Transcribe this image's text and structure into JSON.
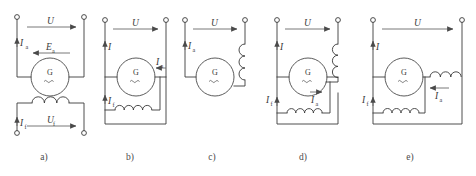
{
  "figure": {
    "type": "schematic-diagram",
    "background_color": "#ffffff",
    "line_color": "#3a3a3a",
    "machine_symbol_letter": "G",
    "panel_count": 5
  },
  "panels": [
    {
      "id": "a",
      "caption": "a)",
      "name": "separately-excited-generator",
      "labels": {
        "supply_voltage": "U",
        "armature_current": "I",
        "armature_current_sub": "a",
        "armature_emf": "E",
        "armature_emf_sub": "a",
        "field_current": "I",
        "field_current_sub": "f",
        "field_voltage": "U",
        "field_voltage_sub": "f"
      },
      "arrows": {
        "supply_voltage_direction": "right",
        "armature_current_direction": "up",
        "armature_emf_direction": "left",
        "field_current_direction": "up",
        "field_voltage_direction": "right"
      },
      "coil_count": 1,
      "terminal_count": 4
    },
    {
      "id": "b",
      "caption": "b)",
      "name": "shunt-excited-generator",
      "labels": {
        "supply_voltage": "U",
        "line_current": "I",
        "line_current_sub": "",
        "armature_current": "I",
        "armature_current_sub": "a",
        "field_current": "I",
        "field_current_sub": "f"
      },
      "arrows": {
        "supply_voltage_direction": "right",
        "line_current_direction": "up",
        "armature_current_direction": "left",
        "field_current_direction": "up"
      },
      "coil_count": 1,
      "terminal_count": 2
    },
    {
      "id": "c",
      "caption": "c)",
      "name": "series-excited-generator",
      "labels": {
        "supply_voltage": "U",
        "armature_current": "I",
        "armature_current_sub": "a"
      },
      "arrows": {
        "supply_voltage_direction": "right",
        "armature_current_direction": "up"
      },
      "coil_count": 1,
      "terminal_count": 2
    },
    {
      "id": "d",
      "caption": "d)",
      "name": "short-shunt-compound-generator",
      "labels": {
        "supply_voltage": "U",
        "line_current": "I",
        "line_current_sub": "",
        "field_current": "I",
        "field_current_sub": "f",
        "armature_current": "I",
        "armature_current_sub": "a"
      },
      "arrows": {
        "supply_voltage_direction": "right",
        "line_current_direction": "up",
        "field_current_direction": "up",
        "armature_current_direction": "right"
      },
      "coil_count": 2,
      "terminal_count": 2
    },
    {
      "id": "e",
      "caption": "e)",
      "name": "long-shunt-compound-generator",
      "labels": {
        "supply_voltage": "U",
        "line_current": "I",
        "line_current_sub": "",
        "field_current": "I",
        "field_current_sub": "f",
        "armature_current": "I",
        "armature_current_sub": "a"
      },
      "arrows": {
        "supply_voltage_direction": "right",
        "line_current_direction": "up",
        "field_current_direction": "up",
        "armature_current_direction": "left"
      },
      "coil_count": 2,
      "terminal_count": 2
    }
  ]
}
